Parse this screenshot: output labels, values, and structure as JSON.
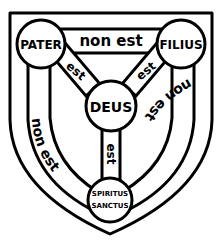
{
  "diagram": {
    "nodes": {
      "pater": "PATER",
      "filius": "FILIUS",
      "deus": "DEUS",
      "spiritus_line1": "SPIRITUS",
      "spiritus_line2": "SANCTUS"
    },
    "links": {
      "top": "non est",
      "left": "non est",
      "right": "non est",
      "pater_deus": "est",
      "filius_deus": "est",
      "deus_spiritus": "est"
    },
    "colors": {
      "ink": "#000000",
      "background": "#ffffff"
    }
  }
}
